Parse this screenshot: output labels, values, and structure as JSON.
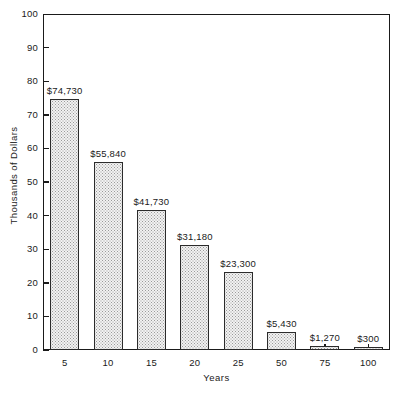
{
  "chart_data": {
    "type": "bar",
    "title": "",
    "xlabel": "Years",
    "ylabel": "Thousands of Dollars",
    "categories": [
      "5",
      "10",
      "15",
      "20",
      "25",
      "50",
      "75",
      "100"
    ],
    "values": [
      74.73,
      55.84,
      41.73,
      31.18,
      23.3,
      5.43,
      1.27,
      0.3
    ],
    "data_labels": [
      "$74,730",
      "$55,840",
      "$41,730",
      "$31,180",
      "$23,300",
      "$5,430",
      "$1,270",
      "$300"
    ],
    "ylim": [
      0,
      100
    ],
    "yticks": [
      "0",
      "10",
      "20",
      "30",
      "40",
      "50",
      "60",
      "70",
      "80",
      "90",
      "100"
    ],
    "grid": false,
    "legend": "none",
    "bar_fill_color": "#f2f2f2",
    "bar_border_color": "#2b2b2b",
    "axis_color": "#1a1a1a",
    "background_color": "#ffffff"
  }
}
